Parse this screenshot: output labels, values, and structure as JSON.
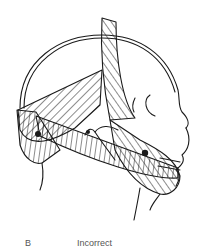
{
  "figure": {
    "panel_label": "B",
    "caption": "Incorrect",
    "colors": {
      "line": "#1a1a1a",
      "background": "#ffffff",
      "label": "#555555"
    }
  }
}
